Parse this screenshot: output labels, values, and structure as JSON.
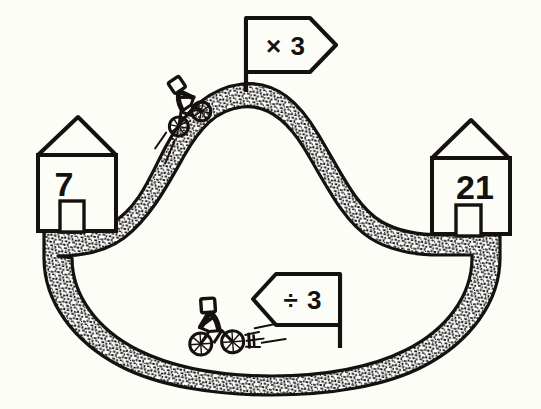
{
  "scene": {
    "title": "Multiply and divide by 3 road diagram",
    "background_color": "#fdfdf8",
    "ink_color": "#14110f",
    "road_fill_color": "#ffffff",
    "road_texture": "stippled-gravel"
  },
  "houses": [
    {
      "name": "start-house",
      "label": "7",
      "position": "left",
      "door": "door-rectangle"
    },
    {
      "name": "end-house",
      "label": "21",
      "position": "right",
      "door": "door-rectangle"
    }
  ],
  "signs": [
    {
      "name": "multiply-sign",
      "label": "× 3",
      "operator": "×",
      "operand": "3",
      "direction": "right",
      "position": "hilltop"
    },
    {
      "name": "divide-sign",
      "label": "÷ 3",
      "operator": "÷",
      "operand": "3",
      "direction": "left",
      "position": "valley"
    }
  ],
  "riders": [
    {
      "name": "uphill-motorcyclist",
      "position": "climbing-left-slope",
      "direction": "uphill-right"
    },
    {
      "name": "valley-motorcyclist",
      "position": "valley-floor",
      "direction": "left"
    }
  ],
  "road": {
    "name": "road-band",
    "description": "Band looping from left house over a hill and down through a valley to the right house"
  }
}
